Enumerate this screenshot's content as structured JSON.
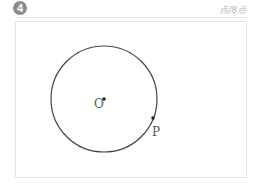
{
  "question": {
    "number": "4",
    "score_label": "点/8点"
  },
  "figure": {
    "shape": "circle",
    "center_label": "O",
    "point_label": "P",
    "stroke_color": "#444444"
  }
}
